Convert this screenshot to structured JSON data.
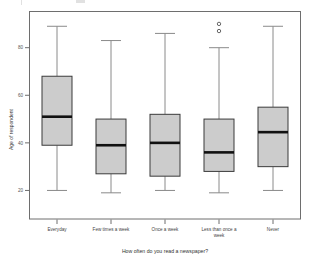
{
  "chart_data": {
    "type": "box",
    "title": "",
    "xlabel": "How often do you read a newspaper?",
    "ylabel": "Age of respondent",
    "ylim": [
      8,
      95
    ],
    "yticks": [
      20,
      40,
      60,
      80
    ],
    "ytick_labels": [
      "20",
      "40",
      "60",
      "80"
    ],
    "grid": false,
    "legend": "none",
    "categories": [
      "Everyday",
      "Few times a week",
      "Once a week",
      "Less than once a week",
      "Never"
    ],
    "boxes": [
      {
        "category": "Everyday",
        "whisker_low": 20,
        "q1": 39,
        "median": 51,
        "q3": 68,
        "whisker_high": 89,
        "outliers": []
      },
      {
        "category": "Few times a week",
        "whisker_low": 19,
        "q1": 27,
        "median": 39,
        "q3": 50,
        "whisker_high": 83,
        "outliers": []
      },
      {
        "category": "Once a week",
        "whisker_low": 20,
        "q1": 26,
        "median": 40,
        "q3": 52,
        "whisker_high": 86,
        "outliers": []
      },
      {
        "category": "Less than once a week",
        "whisker_low": 19,
        "q1": 28,
        "median": 36,
        "q3": 50,
        "whisker_high": 80,
        "outliers": [
          87,
          90
        ]
      },
      {
        "category": "Never",
        "whisker_low": 20,
        "q1": 30,
        "median": 44.5,
        "q3": 55,
        "whisker_high": 89,
        "outliers": []
      }
    ],
    "colors": {
      "box_fill": "#cccccc",
      "box_stroke": "#3a3a3a",
      "median": "#111111",
      "whisker": "#8a8a8a",
      "frame": "#6e6e6e",
      "text": "#444444",
      "background": "#ffffff"
    }
  },
  "category_label_lines": [
    [
      "Everyday"
    ],
    [
      "Few times a week"
    ],
    [
      "Once a week"
    ],
    [
      "Less than once a",
      "week"
    ],
    [
      "Never"
    ]
  ]
}
